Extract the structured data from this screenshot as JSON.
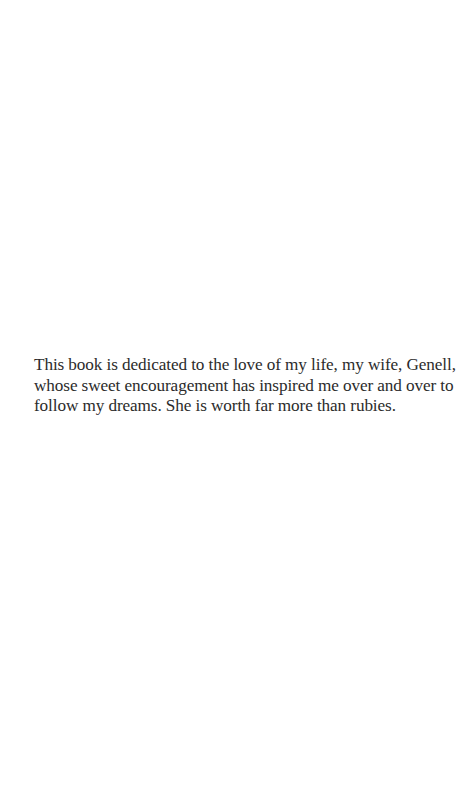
{
  "page": {
    "type": "dedication",
    "background": "#ffffff",
    "text_color": "#2b2b2b"
  },
  "dedication": {
    "lines": [
      "This book is dedicated to the love of my life, my wife, Genell,",
      "whose sweet encouragement has inspired me over and over to",
      "follow my dreams. She is worth far more than rubies."
    ]
  }
}
